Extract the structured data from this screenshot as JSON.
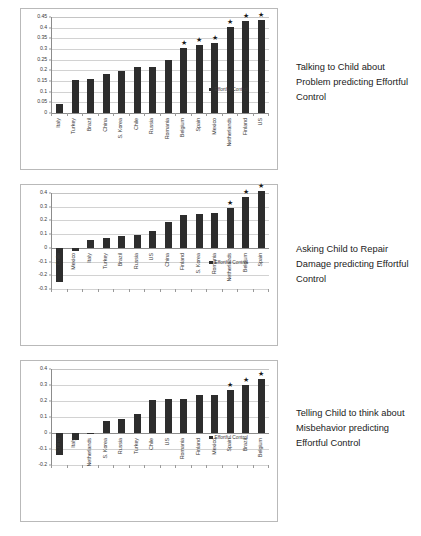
{
  "page": {
    "background": "#ffffff",
    "bar_color": "#2d2d2d",
    "grid_color": "#d2d2d2",
    "axis_color": "#8c8c8c",
    "star_glyph": "★",
    "legend_label": "Effortful Control"
  },
  "figures": [
    {
      "caption": "Talking to Child about Problem predicting Effortful Control",
      "legend_label": "Effortful Control",
      "chart_data": {
        "type": "bar",
        "title": "Talking to Child about Problem predicting Effortful Control",
        "xlabel": "",
        "ylabel": "",
        "ylim": [
          0,
          0.45
        ],
        "ytick_step": 0.05,
        "yticks": [
          0.45,
          0.4,
          0.35,
          0.3,
          0.25,
          0.2,
          0.15,
          0.1,
          0.05,
          0
        ],
        "ytick_labels": [
          "0.45",
          "0.4",
          "0.35",
          "0.3",
          "0.25",
          "0.2",
          "0.15",
          "0.1",
          "0.05",
          "0"
        ],
        "grid": true,
        "legend": "Effortful Control",
        "legend_position": "right",
        "categories": [
          "Italy",
          "Turkey",
          "Brazil",
          "China",
          "S. Korea",
          "Chile",
          "Russia",
          "Romania",
          "Belgium",
          "Spain",
          "Mexico",
          "Netherlands",
          "Finland",
          "US"
        ],
        "values": [
          0.04,
          0.155,
          0.158,
          0.185,
          0.195,
          0.215,
          0.217,
          0.248,
          0.305,
          0.318,
          0.327,
          0.405,
          0.43,
          0.437
        ],
        "significant": [
          false,
          false,
          false,
          false,
          false,
          false,
          false,
          false,
          true,
          true,
          true,
          true,
          true,
          true
        ],
        "annotations": [
          "",
          "",
          "",
          "",
          "",
          "",
          "",
          "",
          "*",
          "*",
          "*",
          "*",
          "*",
          "*"
        ]
      }
    },
    {
      "caption": "Asking Child to Repair Damage predicting Effortful Control",
      "legend_label": "Effortful Control",
      "chart_data": {
        "type": "bar",
        "title": "Asking Child to Repair Damage predicting Effortful Control",
        "xlabel": "",
        "ylabel": "",
        "ylim": [
          -0.3,
          0.4
        ],
        "ytick_step": 0.1,
        "yticks": [
          0.4,
          0.3,
          0.2,
          0.1,
          0,
          -0.1,
          -0.2,
          -0.3
        ],
        "ytick_labels": [
          "0.4",
          "0.3",
          "0.2",
          "0.1",
          "0",
          "-0.1",
          "-0.2",
          "-0.3"
        ],
        "grid": true,
        "legend": "Effortful Control",
        "legend_position": "right",
        "categories": [
          "Chile",
          "Mexico",
          "Italy",
          "Turkey",
          "Brazil",
          "Russia",
          "US",
          "China",
          "Finland",
          "S. Korea",
          "Romania",
          "Netherlands",
          "Belgium",
          "Spain"
        ],
        "values": [
          -0.25,
          -0.02,
          0.06,
          0.075,
          0.083,
          0.095,
          0.12,
          0.19,
          0.237,
          0.248,
          0.257,
          0.29,
          0.368,
          0.412
        ],
        "significant": [
          false,
          false,
          false,
          false,
          false,
          false,
          false,
          false,
          false,
          false,
          false,
          true,
          true,
          true
        ],
        "annotations": [
          "",
          "",
          "",
          "",
          "",
          "",
          "",
          "",
          "",
          "",
          "",
          "*",
          "*",
          "*"
        ]
      }
    },
    {
      "caption": "Telling Child to think about Misbehavior predicting Effortful Control",
      "legend_label": "Effortful Control",
      "chart_data": {
        "type": "bar",
        "title": "Telling Child to think about Misbehavior predicting Effortful Control",
        "xlabel": "",
        "ylabel": "",
        "ylim": [
          -0.2,
          0.4
        ],
        "ytick_step": 0.1,
        "yticks": [
          0.4,
          0.3,
          0.2,
          0.1,
          0,
          -0.1,
          -0.2
        ],
        "ytick_labels": [
          "0.4",
          "0.3",
          "0.2",
          "0.1",
          "0",
          "-0.1",
          "-0.2"
        ],
        "grid": true,
        "legend": "Effortful Control",
        "legend_position": "right",
        "categories": [
          "China",
          "Italy",
          "Netherlands",
          "S. Korea",
          "Russia",
          "Turkey",
          "Chile",
          "US",
          "Romania",
          "Finland",
          "Mexico",
          "Spain",
          "Brazil",
          "Belgium"
        ],
        "values": [
          -0.14,
          -0.045,
          -0.006,
          0.077,
          0.085,
          0.117,
          0.205,
          0.213,
          0.215,
          0.238,
          0.24,
          0.268,
          0.297,
          0.337
        ],
        "significant": [
          false,
          false,
          false,
          false,
          false,
          false,
          false,
          false,
          false,
          false,
          false,
          true,
          true,
          true
        ],
        "annotations": [
          "",
          "",
          "",
          "",
          "",
          "",
          "",
          "",
          "",
          "",
          "",
          "*",
          "*",
          "*"
        ]
      }
    }
  ]
}
